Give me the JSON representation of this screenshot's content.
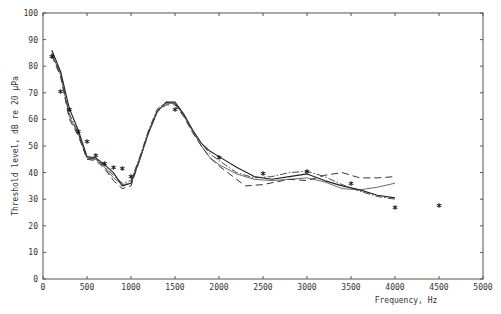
{
  "chart_data": {
    "type": "line",
    "title": "",
    "xlabel": "Frequency, Hz",
    "ylabel": "Threshold level, dB re 20 µPa",
    "xlim": [
      0,
      5000
    ],
    "ylim": [
      0,
      100
    ],
    "x_ticks": [
      0,
      500,
      1000,
      1500,
      2000,
      2500,
      3000,
      3500,
      4000,
      4500,
      5000
    ],
    "y_ticks": [
      0,
      10,
      20,
      30,
      40,
      50,
      60,
      70,
      80,
      90,
      100
    ],
    "grid": false,
    "legend": null,
    "series": [
      {
        "name": "curve-solid",
        "style": "solid",
        "points": [
          [
            100,
            86
          ],
          [
            200,
            78
          ],
          [
            300,
            64
          ],
          [
            400,
            56
          ],
          [
            500,
            46
          ],
          [
            600,
            45.5
          ],
          [
            700,
            43
          ],
          [
            800,
            40
          ],
          [
            900,
            35
          ],
          [
            1000,
            36
          ],
          [
            1100,
            45
          ],
          [
            1200,
            55
          ],
          [
            1300,
            63
          ],
          [
            1400,
            66.5
          ],
          [
            1500,
            66.5
          ],
          [
            1600,
            62
          ],
          [
            1700,
            56
          ],
          [
            1800,
            51
          ],
          [
            1900,
            48
          ],
          [
            2000,
            46
          ],
          [
            2200,
            42
          ],
          [
            2400,
            38.5
          ],
          [
            2600,
            37.5
          ],
          [
            2800,
            38.5
          ],
          [
            3000,
            39.5
          ],
          [
            3200,
            37
          ],
          [
            3400,
            35
          ],
          [
            3600,
            33.5
          ],
          [
            3800,
            31.5
          ],
          [
            4000,
            30.5
          ]
        ]
      },
      {
        "name": "curve-dash-dot",
        "style": "dashdot",
        "points": [
          [
            100,
            85
          ],
          [
            200,
            77
          ],
          [
            300,
            62
          ],
          [
            400,
            55
          ],
          [
            500,
            45.5
          ],
          [
            600,
            45
          ],
          [
            700,
            42.5
          ],
          [
            800,
            39
          ],
          [
            900,
            36
          ],
          [
            1000,
            37
          ],
          [
            1100,
            46
          ],
          [
            1200,
            56
          ],
          [
            1300,
            64
          ],
          [
            1400,
            66.5
          ],
          [
            1500,
            66
          ],
          [
            1600,
            61.5
          ],
          [
            1700,
            56
          ],
          [
            1800,
            51
          ],
          [
            1900,
            47
          ],
          [
            2000,
            44.5
          ],
          [
            2200,
            40
          ],
          [
            2400,
            38
          ],
          [
            2600,
            38.5
          ],
          [
            2800,
            40
          ],
          [
            3000,
            40.5
          ],
          [
            3200,
            38.5
          ],
          [
            3400,
            35.5
          ],
          [
            3600,
            33
          ],
          [
            3800,
            31
          ],
          [
            4000,
            30
          ]
        ]
      },
      {
        "name": "curve-long-dash",
        "style": "dashed",
        "points": [
          [
            100,
            84
          ],
          [
            200,
            76
          ],
          [
            300,
            60
          ],
          [
            400,
            54
          ],
          [
            500,
            45
          ],
          [
            600,
            44.5
          ],
          [
            700,
            41.5
          ],
          [
            800,
            37
          ],
          [
            900,
            34
          ],
          [
            1000,
            35
          ],
          [
            1100,
            45
          ],
          [
            1200,
            55
          ],
          [
            1300,
            63
          ],
          [
            1400,
            65.5
          ],
          [
            1500,
            65.5
          ],
          [
            1600,
            61
          ],
          [
            1700,
            55
          ],
          [
            1800,
            50
          ],
          [
            1900,
            45.5
          ],
          [
            2000,
            42.5
          ],
          [
            2200,
            37.5
          ],
          [
            2300,
            35
          ],
          [
            2500,
            35.5
          ],
          [
            2800,
            37.5
          ],
          [
            3000,
            37
          ],
          [
            3200,
            39
          ],
          [
            3400,
            40
          ],
          [
            3600,
            38
          ],
          [
            3800,
            38
          ],
          [
            4000,
            38.5
          ]
        ]
      },
      {
        "name": "curve-thin",
        "style": "solid-thin",
        "points": [
          [
            100,
            84.5
          ],
          [
            200,
            77
          ],
          [
            300,
            61
          ],
          [
            400,
            54.5
          ],
          [
            500,
            45.5
          ],
          [
            600,
            45
          ],
          [
            700,
            42
          ],
          [
            800,
            38
          ],
          [
            900,
            35.5
          ],
          [
            1000,
            36
          ],
          [
            1100,
            45
          ],
          [
            1200,
            55.5
          ],
          [
            1300,
            63.5
          ],
          [
            1400,
            66
          ],
          [
            1500,
            66
          ],
          [
            1600,
            61.5
          ],
          [
            1700,
            55.5
          ],
          [
            1800,
            50
          ],
          [
            1900,
            45.5
          ],
          [
            2000,
            43
          ],
          [
            2200,
            39.5
          ],
          [
            2400,
            37.5
          ],
          [
            2600,
            37
          ],
          [
            2800,
            37.5
          ],
          [
            3000,
            38
          ],
          [
            3200,
            36.5
          ],
          [
            3400,
            34
          ],
          [
            3600,
            33.5
          ],
          [
            3800,
            34.5
          ],
          [
            4000,
            36
          ]
        ]
      },
      {
        "name": "measured-points",
        "style": "asterisk",
        "points": [
          [
            100,
            83
          ],
          [
            200,
            70
          ],
          [
            300,
            63
          ],
          [
            400,
            55
          ],
          [
            500,
            51
          ],
          [
            600,
            46
          ],
          [
            700,
            43
          ],
          [
            800,
            41.5
          ],
          [
            900,
            41
          ],
          [
            1000,
            38
          ],
          [
            1500,
            63
          ],
          [
            2000,
            45
          ],
          [
            2500,
            39
          ],
          [
            3000,
            40
          ],
          [
            3500,
            35.5
          ],
          [
            4000,
            26.5
          ],
          [
            4500,
            27
          ]
        ]
      }
    ]
  }
}
